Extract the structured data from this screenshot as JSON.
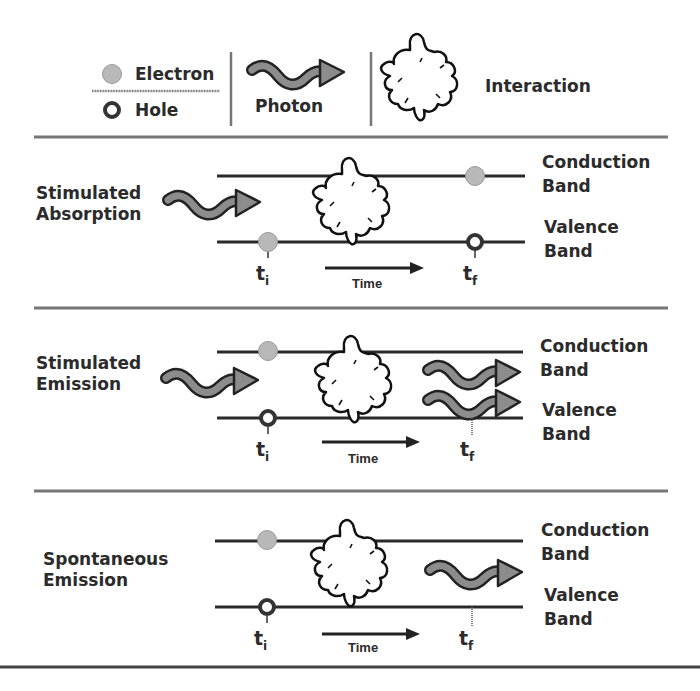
{
  "legend": {
    "electron_label": "Electron",
    "hole_label": "Hole",
    "photon_label": "Photon",
    "interaction_label": "Interaction"
  },
  "colors": {
    "electron_fill": "#b8b8b8",
    "photon_fill": "#8c8c8c",
    "line": "#2a2a2a",
    "separator": "#777777"
  },
  "processes": [
    {
      "title_line1": "Stimulated",
      "title_line2": "Absorption",
      "conduction_line1": "Conduction",
      "conduction_line2": "Band",
      "valence_line1": "Valence",
      "valence_line2": "Band",
      "t_initial": "t",
      "t_initial_sub": "i",
      "t_final": "t",
      "t_final_sub": "f",
      "time_label": "Time",
      "initial_state": "electron in valence band",
      "final_state": "electron in conduction band, hole in valence band",
      "incoming_photons": 1,
      "outgoing_photons": 0
    },
    {
      "title_line1": "Stimulated",
      "title_line2": "Emission",
      "conduction_line1": "Conduction",
      "conduction_line2": "Band",
      "valence_line1": "Valence",
      "valence_line2": "Band",
      "t_initial": "t",
      "t_initial_sub": "i",
      "t_final": "t",
      "t_final_sub": "f",
      "time_label": "Time",
      "initial_state": "electron in conduction band, hole in valence band",
      "final_state": "recombined",
      "incoming_photons": 1,
      "outgoing_photons": 2
    },
    {
      "title_line1": "Spontaneous",
      "title_line2": "Emission",
      "conduction_line1": "Conduction",
      "conduction_line2": "Band",
      "valence_line1": "Valence",
      "valence_line2": "Band",
      "t_initial": "t",
      "t_initial_sub": "i",
      "t_final": "t",
      "t_final_sub": "f",
      "time_label": "Time",
      "initial_state": "electron in conduction band, hole in valence band",
      "final_state": "recombined",
      "incoming_photons": 0,
      "outgoing_photons": 1
    }
  ]
}
